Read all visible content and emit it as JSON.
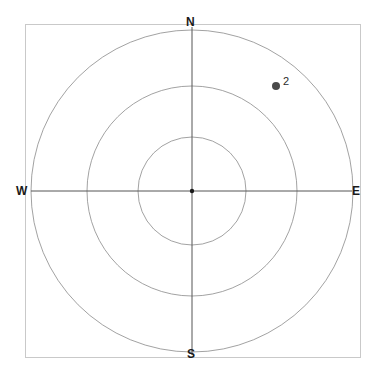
{
  "figure": {
    "title": "",
    "background_color": "#ffffff",
    "frame_color": "#c9c9c9",
    "grid_color": "#8a8a8a",
    "axis_color": "#555555",
    "point_color": "#4a4a4a",
    "label_color": "#1a1a1a"
  },
  "compass": {
    "north_label": "N",
    "south_label": "S",
    "west_label": "W",
    "east_label": "E"
  },
  "chart_data": {
    "type": "scatter",
    "subtype": "polar-compass",
    "title": "",
    "xlabel": "",
    "ylabel": "",
    "center": {
      "x": 192,
      "y": 191
    },
    "grid": true,
    "legend_position": "none",
    "axis_directions": [
      "N",
      "E",
      "S",
      "W"
    ],
    "radial_rings": [
      {
        "index": 1,
        "radius_px": 54
      },
      {
        "index": 2,
        "radius_px": 105
      },
      {
        "index": 3,
        "radius_px": 161
      }
    ],
    "points": [
      {
        "label": "2",
        "x_px": 276,
        "y_px": 86,
        "dx_from_center_px": 84,
        "dy_from_center_px": -105,
        "radius_px": 134.5,
        "bearing_deg": 38.7,
        "quadrant": "NE"
      }
    ],
    "frame_box": {
      "left": 25,
      "top": 24,
      "right": 360,
      "bottom": 357
    }
  }
}
